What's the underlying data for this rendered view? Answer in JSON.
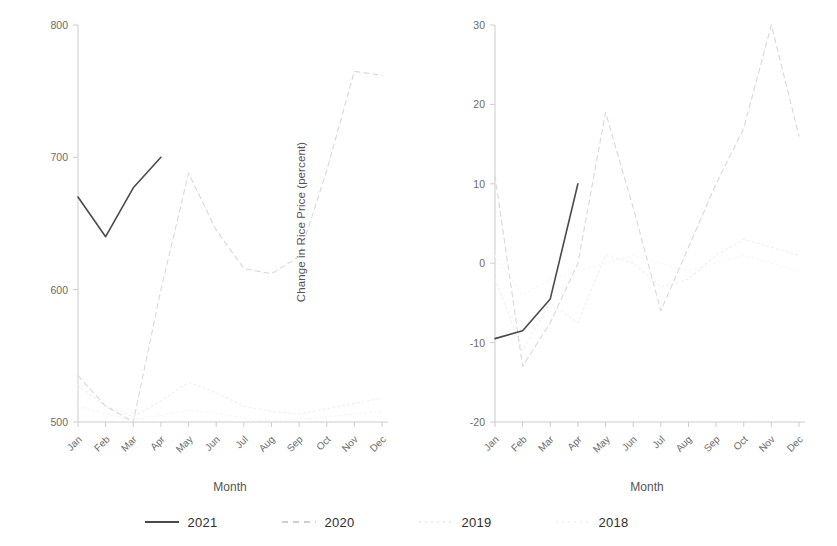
{
  "chart_data": [
    {
      "type": "line",
      "panel": "left",
      "title": "",
      "xlabel": "Month",
      "ylabel": "Price of Rice (ariare)",
      "categories": [
        "Jan",
        "Feb",
        "Mar",
        "Apr",
        "May",
        "Jun",
        "Jul",
        "Aug",
        "Sep",
        "Oct",
        "Nov",
        "Dec"
      ],
      "ylim": [
        500,
        800
      ],
      "yticks": [
        500,
        600,
        700,
        800
      ],
      "grid": false,
      "legend_position": "bottom",
      "series": [
        {
          "name": "2021",
          "style": "solid",
          "color": "#4a4a4a",
          "values": [
            670,
            640,
            677,
            700,
            null,
            null,
            null,
            null,
            null,
            null,
            null,
            null
          ]
        },
        {
          "name": "2020",
          "style": "dashed",
          "color": "#d8d8d8",
          "values": [
            535,
            512,
            500,
            600,
            688,
            645,
            616,
            612,
            625,
            690,
            765,
            762
          ]
        },
        {
          "name": "2019",
          "style": "dotted",
          "color": "#efefef",
          "values": [
            528,
            512,
            504,
            516,
            530,
            522,
            512,
            508,
            506,
            510,
            514,
            518
          ]
        },
        {
          "name": "2018",
          "style": "dotted",
          "color": "#f5f5f5",
          "values": [
            512,
            506,
            502,
            505,
            509,
            507,
            503,
            501,
            502,
            504,
            506,
            508
          ]
        }
      ]
    },
    {
      "type": "line",
      "panel": "right",
      "title": "",
      "xlabel": "Month",
      "ylabel": "Change in Rice Price (percent)",
      "categories": [
        "Jan",
        "Feb",
        "Mar",
        "Apr",
        "May",
        "Jun",
        "Jul",
        "Aug",
        "Sep",
        "Oct",
        "Nov",
        "Dec"
      ],
      "ylim": [
        -20,
        30
      ],
      "yticks": [
        -20,
        -10,
        0,
        10,
        20,
        30
      ],
      "grid": false,
      "legend_position": "bottom",
      "series": [
        {
          "name": "2021",
          "style": "solid",
          "color": "#4a4a4a",
          "values": [
            -9.5,
            -8.5,
            -4.5,
            10,
            null,
            null,
            null,
            null,
            null,
            null,
            null,
            null
          ]
        },
        {
          "name": "2020",
          "style": "dashed",
          "color": "#d8d8d8",
          "values": [
            11,
            -13,
            -7.5,
            0,
            19,
            7,
            -6,
            2,
            10,
            17,
            30,
            16
          ]
        },
        {
          "name": "2019",
          "style": "dotted",
          "color": "#efefef",
          "values": [
            -2,
            -11,
            -5,
            -7.5,
            1,
            0,
            -3,
            -2,
            1,
            3,
            2,
            1
          ]
        },
        {
          "name": "2018",
          "style": "dotted",
          "color": "#f6f6f6",
          "values": [
            1,
            -4,
            -2,
            -1,
            0,
            1,
            0,
            -1,
            0,
            1,
            0,
            -1
          ]
        }
      ]
    }
  ],
  "left_chart": {
    "ylabel": "Price of Rice (ariare)",
    "xlabel": "Month",
    "yticks": [
      "800",
      "700",
      "600",
      "500"
    ],
    "xticks": [
      "Jan",
      "Feb",
      "Mar",
      "Apr",
      "May",
      "Jun",
      "Jul",
      "Aug",
      "Sep",
      "Oct",
      "Nov",
      "Dec"
    ]
  },
  "right_chart": {
    "ylabel": "Change in Rice Price (percent)",
    "xlabel": "Month",
    "yticks": [
      "30",
      "20",
      "10",
      "0",
      "-10",
      "-20"
    ],
    "xticks": [
      "Jan",
      "Feb",
      "Mar",
      "Apr",
      "May",
      "Jun",
      "Jul",
      "Aug",
      "Sep",
      "Oct",
      "Nov",
      "Dec"
    ]
  },
  "legend": {
    "items": [
      {
        "label": "2021",
        "color": "#4a4a4a",
        "style": "solid"
      },
      {
        "label": "2020",
        "color": "#cfcfcf",
        "style": "dashed"
      },
      {
        "label": "2019",
        "color": "#eeeeee",
        "style": "dotted"
      },
      {
        "label": "2018",
        "color": "#f4f4f4",
        "style": "dotted"
      }
    ]
  },
  "colors": {
    "axis": "#cccccc",
    "tick_text": "#6a6a6a",
    "label_text": "#555555",
    "series_2021": "#4a4a4a",
    "series_2020": "#d8d8d8",
    "series_2019": "#efefef",
    "series_2018": "#f5f5f5"
  }
}
